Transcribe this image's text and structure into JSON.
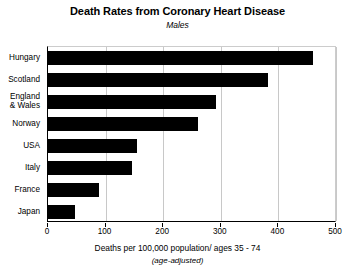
{
  "chart_data": {
    "type": "bar",
    "orientation": "horizontal",
    "title": "Death Rates from Coronary Heart Disease",
    "subtitle": "Males",
    "xlabel": "Deaths per 100,000 population/ ages 35 - 74",
    "xnote": "(age-adjusted)",
    "ylabel": "",
    "categories": [
      "Hungary",
      "Scotland",
      "England\n& Wales",
      "Norway",
      "USA",
      "Italy",
      "France",
      "Japan"
    ],
    "category_lines": [
      [
        "Hungary"
      ],
      [
        "Scotland"
      ],
      [
        "England",
        "& Wales"
      ],
      [
        "Norway"
      ],
      [
        "USA"
      ],
      [
        "Italy"
      ],
      [
        "France"
      ],
      [
        "Japan"
      ]
    ],
    "values": [
      460,
      382,
      292,
      261,
      155,
      145,
      88,
      47
    ],
    "xlim": [
      0,
      500
    ],
    "xticks": [
      0,
      100,
      200,
      300,
      400,
      500
    ],
    "xtick_labels": [
      "0",
      "100",
      "200",
      "300",
      "400",
      "500"
    ],
    "grid": true,
    "grid_axis": "x",
    "legend": null,
    "bar_color": "#000000",
    "background_color": "#ffffff",
    "grid_color": "#c8c8c8"
  }
}
